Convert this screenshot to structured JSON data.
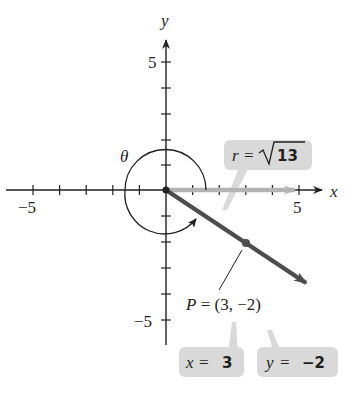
{
  "diagram": {
    "axes": {
      "x_label": "x",
      "y_label": "y",
      "x_tick_neg": "−5",
      "x_tick_pos": "5",
      "y_tick_pos": "5",
      "y_tick_neg": "−5",
      "range": [
        -5,
        5
      ]
    },
    "angle_label": "θ",
    "point": {
      "label": "P = (3, −2)",
      "x": 3,
      "y": -2
    },
    "callouts": {
      "r": {
        "lhs": "r = ",
        "radical": "13"
      },
      "x": {
        "lhs": "x = ",
        "value": "3"
      },
      "y": {
        "lhs": "y = ",
        "value": "−2"
      }
    },
    "colors": {
      "axis": "#231f20",
      "terminal_ray": "#4d4d4f",
      "initial_ray": "#b3b3b3",
      "callout_bg": "#d9d9d9"
    }
  }
}
